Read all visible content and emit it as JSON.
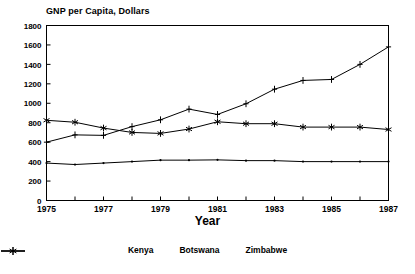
{
  "chart_data": {
    "type": "line",
    "title": "GNP per Capita, Dollars",
    "xlabel": "Year",
    "ylabel": "",
    "x": [
      1975,
      1976,
      1977,
      1978,
      1979,
      1980,
      1981,
      1982,
      1983,
      1984,
      1985,
      1986,
      1987
    ],
    "xlim": [
      1975,
      1987
    ],
    "ylim": [
      0,
      1800
    ],
    "xticks": [
      1975,
      1976,
      1977,
      1978,
      1979,
      1980,
      1981,
      1982,
      1983,
      1984,
      1985,
      1986,
      1987
    ],
    "xtick_labels": [
      "1975",
      "",
      "1977",
      "",
      "1979",
      "",
      "1981",
      "",
      "1983",
      "",
      "1985",
      "",
      "1987"
    ],
    "yticks": [
      0,
      200,
      400,
      600,
      800,
      1000,
      1200,
      1400,
      1600,
      1800
    ],
    "ytick_labels": [
      "0",
      "200",
      "400",
      "600",
      "800",
      "1000",
      "1200",
      "1400",
      "1600",
      "1800"
    ],
    "grid": false,
    "legend_position": "bottom",
    "line_color": "#000000",
    "series": [
      {
        "name": "Kenya",
        "marker": "dot",
        "values": [
          385,
          370,
          385,
          400,
          415,
          415,
          418,
          410,
          410,
          400,
          400,
          400,
          400
        ]
      },
      {
        "name": "Botswana",
        "marker": "plus",
        "values": [
          600,
          675,
          670,
          760,
          830,
          940,
          885,
          995,
          1145,
          1235,
          1245,
          1400,
          1580
        ]
      },
      {
        "name": "Zimbabwe",
        "marker": "asterisk",
        "values": [
          825,
          805,
          745,
          700,
          690,
          735,
          810,
          790,
          790,
          755,
          755,
          755,
          730
        ]
      }
    ]
  }
}
